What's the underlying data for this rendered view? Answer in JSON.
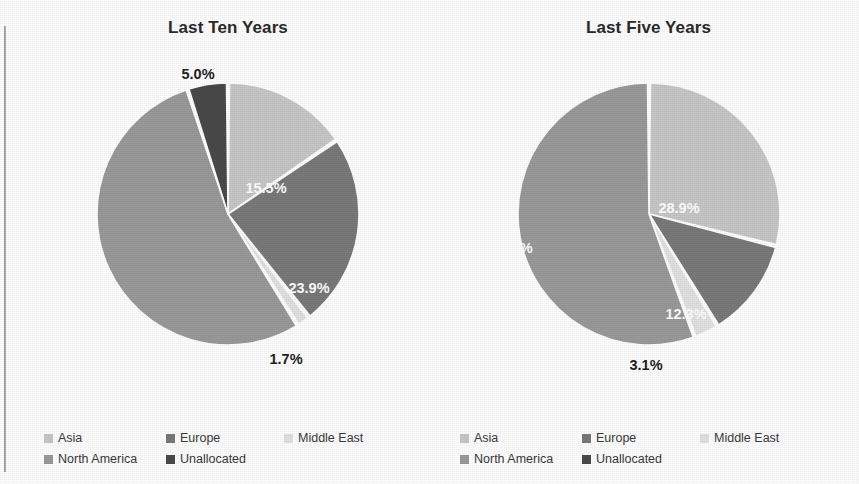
{
  "colors": {
    "asia": "#c8c8c8",
    "europe": "#7a7a7a",
    "middle_east": "#e2e2e2",
    "north_america": "#9a9a9a",
    "unallocated": "#4a4a4a",
    "label_inside": "#ffffff",
    "label_outside": "#1f1f1f",
    "background": "#ffffff"
  },
  "legend": {
    "items": [
      {
        "label": "Asia",
        "color": "#c8c8c8"
      },
      {
        "label": "Europe",
        "color": "#7a7a7a"
      },
      {
        "label": "Middle East",
        "color": "#e2e2e2"
      },
      {
        "label": "North America",
        "color": "#9a9a9a"
      },
      {
        "label": "Unallocated",
        "color": "#4a4a4a"
      }
    ]
  },
  "left": {
    "title": "Last Ten Years",
    "labels": {
      "asia": "15.5%",
      "europe": "23.9%",
      "middle_east": "1.7%",
      "north_america": "53.9%",
      "unallocated": "5.0%"
    }
  },
  "right": {
    "title": "Last Five Years",
    "labels": {
      "asia": "28.9%",
      "europe": "12.3%",
      "middle_east": "3.1%",
      "north_america": "55.6%"
    }
  },
  "chart_data": [
    {
      "type": "pie",
      "title": "Last Ten Years",
      "categories": [
        "Asia",
        "Europe",
        "Middle East",
        "North America",
        "Unallocated"
      ],
      "values": [
        15.5,
        23.9,
        1.7,
        53.9,
        5.0
      ],
      "value_labels": [
        "15.5%",
        "23.9%",
        "1.7%",
        "53.9%",
        "5.0%"
      ],
      "colors": [
        "#c8c8c8",
        "#7a7a7a",
        "#e2e2e2",
        "#9a9a9a",
        "#4a4a4a"
      ],
      "units": "percent",
      "start_angle_deg": 0,
      "direction": "clockwise",
      "legend": "bottom",
      "grid": false
    },
    {
      "type": "pie",
      "title": "Last Five Years",
      "categories": [
        "Asia",
        "Europe",
        "Middle East",
        "North America",
        "Unallocated"
      ],
      "values": [
        28.9,
        12.3,
        3.1,
        55.6,
        0.0
      ],
      "value_labels": [
        "28.9%",
        "12.3%",
        "3.1%",
        "55.6%",
        ""
      ],
      "colors": [
        "#c8c8c8",
        "#7a7a7a",
        "#e2e2e2",
        "#9a9a9a",
        "#4a4a4a"
      ],
      "units": "percent",
      "start_angle_deg": 0,
      "direction": "clockwise",
      "legend": "bottom",
      "grid": false
    }
  ]
}
